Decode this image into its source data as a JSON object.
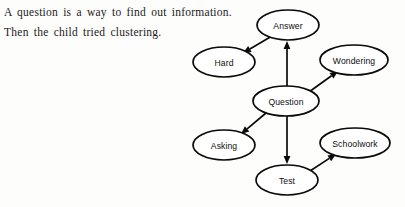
{
  "page": {
    "background_color": "#fdfdfc",
    "ink_color": "#0a0a0a"
  },
  "prose": {
    "line1": "A question is a way to find out information.",
    "line2": "Then the child tried clustering."
  },
  "diagram": {
    "type": "concept-map",
    "nodes": [
      {
        "id": "answer",
        "label": "Answer",
        "cx": 288,
        "cy": 25,
        "rx": 31,
        "ry": 15
      },
      {
        "id": "hard",
        "label": "Hard",
        "cx": 224,
        "cy": 62,
        "rx": 31,
        "ry": 15
      },
      {
        "id": "wondering",
        "label": "Wondering",
        "cx": 354,
        "cy": 60,
        "rx": 34,
        "ry": 15
      },
      {
        "id": "question",
        "label": "Question",
        "cx": 286,
        "cy": 101,
        "rx": 33,
        "ry": 15
      },
      {
        "id": "asking",
        "label": "Asking",
        "cx": 224,
        "cy": 145,
        "rx": 31,
        "ry": 15
      },
      {
        "id": "schoolwork",
        "label": "Schoolwork",
        "cx": 355,
        "cy": 143,
        "rx": 35,
        "ry": 15
      },
      {
        "id": "test",
        "label": "Test",
        "cx": 287,
        "cy": 180,
        "rx": 31,
        "ry": 15
      }
    ],
    "edges": [
      {
        "id": "question-answer",
        "from": "question",
        "to": "answer",
        "direction": "up",
        "x1": 287,
        "y1": 86,
        "x2": 287,
        "y2": 41
      },
      {
        "id": "answer-hard",
        "from": "answer",
        "to": "hard",
        "direction": "down-left",
        "x1": 272,
        "y1": 36,
        "x2": 243,
        "y2": 53
      },
      {
        "id": "question-wondering",
        "from": "question",
        "to": "wondering",
        "direction": "up-right",
        "x1": 309,
        "y1": 92,
        "x2": 338,
        "y2": 71
      },
      {
        "id": "question-asking",
        "from": "question",
        "to": "asking",
        "direction": "down-left",
        "x1": 266,
        "y1": 113,
        "x2": 241,
        "y2": 134
      },
      {
        "id": "question-test",
        "from": "question",
        "to": "test",
        "direction": "down",
        "x1": 287,
        "y1": 116,
        "x2": 287,
        "y2": 164
      },
      {
        "id": "test-schoolwork",
        "from": "test",
        "to": "schoolwork",
        "direction": "up-right",
        "x1": 310,
        "y1": 171,
        "x2": 336,
        "y2": 154
      }
    ]
  }
}
